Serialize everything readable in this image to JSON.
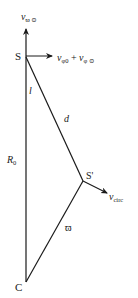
{
  "diagram": {
    "colors": {
      "stroke": "#1a1a1a",
      "background": "#ffffff"
    },
    "points": {
      "S": {
        "label": "S",
        "x": 26,
        "y": 56
      },
      "S_prime": {
        "label": "S'",
        "x": 83,
        "y": 181
      },
      "C": {
        "label": "C",
        "x": 26,
        "y": 282
      }
    },
    "vectors": {
      "v_vertical": {
        "base": "v",
        "subscript": "ϖ ⊙",
        "x1": 26,
        "y1": 56,
        "x2": 26,
        "y2": 28
      },
      "v_horizontal": {
        "base1": "v",
        "sub1": "φ0",
        "plus": " + ",
        "base2": "v",
        "sub2": "φ ⊙",
        "x1": 26,
        "y1": 56,
        "x2": 53,
        "y2": 56
      },
      "v_circ": {
        "base": "v",
        "subscript": "circ",
        "x1": 83,
        "y1": 181,
        "x2": 108,
        "y2": 194
      }
    },
    "segments": {
      "SC": {
        "label_base": "R",
        "label_sub": "0",
        "label": "R0"
      },
      "SSprime": {
        "label": "d"
      },
      "angle_l": {
        "label": "l"
      },
      "SprimeC": {
        "label": "ϖ"
      }
    }
  }
}
